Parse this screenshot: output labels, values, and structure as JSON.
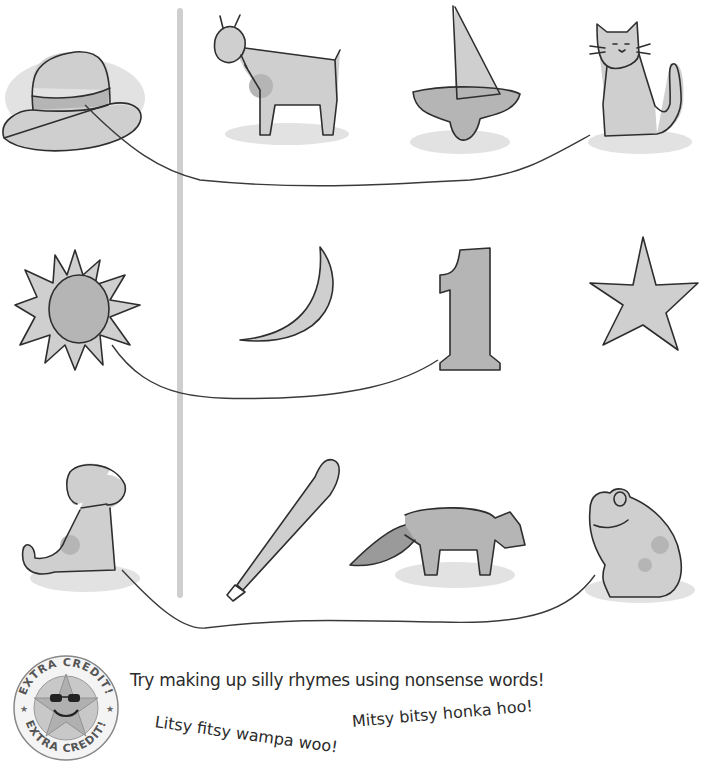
{
  "worksheet": {
    "rows": [
      {
        "items": [
          {
            "name": "hat",
            "connected": true
          },
          {
            "name": "goat",
            "connected": false
          },
          {
            "name": "boat",
            "connected": false
          },
          {
            "name": "cat",
            "connected": true
          }
        ],
        "match": [
          "hat",
          "cat"
        ]
      },
      {
        "items": [
          {
            "name": "sun",
            "connected": true
          },
          {
            "name": "moon",
            "connected": false
          },
          {
            "name": "one",
            "connected": true
          },
          {
            "name": "star",
            "connected": false
          }
        ],
        "match": [
          "sun",
          "one"
        ]
      },
      {
        "items": [
          {
            "name": "dog",
            "connected": true
          },
          {
            "name": "bat",
            "connected": false
          },
          {
            "name": "raccoon-dog",
            "connected": false
          },
          {
            "name": "frog",
            "connected": true
          }
        ],
        "match": [
          "dog",
          "frog"
        ]
      }
    ],
    "number_glyph": "1"
  },
  "extra_credit": {
    "badge_text_top": "EXTRA CREDIT!",
    "badge_text_bottom": "EXTRA CREDIT!",
    "prompt": "Try making up silly rhymes using nonsense words!",
    "rhymes": [
      "Litsy fitsy wampa woo!",
      "Mitsy bitsy honka hoo!"
    ]
  },
  "colors": {
    "ink": "#2e2e2e",
    "wash_light": "#cfcfcf",
    "wash_mid": "#b5b5b5",
    "divider": "#cfcfcf"
  }
}
